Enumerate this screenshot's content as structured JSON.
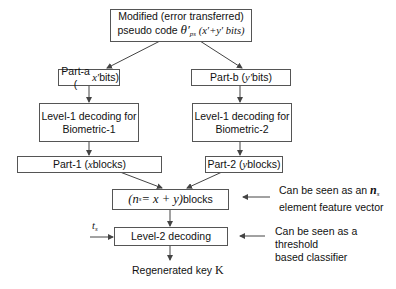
{
  "diagram": {
    "top": {
      "line1": "Modified (error transferred)",
      "line2_prefix": "pseudo code ",
      "symbol": "θ′",
      "symbol_sub": "ps",
      "bits": " (x′+y′ bits)"
    },
    "part_a": {
      "label": "Part-a (",
      "var": "x′",
      "suffix": " bits)"
    },
    "part_b": {
      "label": "Part-b (",
      "var": "y′",
      "suffix": " bits)"
    },
    "level1_left": {
      "line1": "Level-1 decoding for",
      "line2": "Biometric-1"
    },
    "level1_right": {
      "line1": "Level-1 decoding for",
      "line2": "Biometric-2"
    },
    "part_1": {
      "label": "Part-1 (",
      "var": "x",
      "suffix": " blocks)"
    },
    "part_2": {
      "label": "Part-2 (",
      "var": "y",
      "suffix": " blocks)"
    },
    "combined": {
      "expr_open": "(n",
      "expr_sub": "s",
      "expr_rest": " = x + y)",
      "suffix": " blocks"
    },
    "level2": {
      "label": "Level-2 decoding"
    },
    "threshold_input": {
      "symbol": "t",
      "sub": "s"
    },
    "output": {
      "label": "Regenerated key ",
      "symbol": "K"
    },
    "annotations": [
      {
        "line1": "Can be seen as an ",
        "symbol": "n",
        "sub": "s",
        "line2": "element feature vector"
      },
      {
        "line1": "Can be seen as a threshold",
        "line2": "based classifier"
      }
    ]
  }
}
